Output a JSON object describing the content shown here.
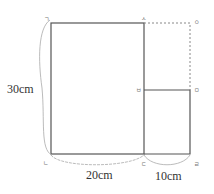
{
  "diagram": {
    "points": {
      "top_left": "ㄱ",
      "top_mid": "ㅅ",
      "top_right": "ㅇ",
      "mid_left": "ㅂ",
      "mid_right": "ㅁ",
      "bottom_left": "ㄴ",
      "bottom_mid": "ㄷ",
      "bottom_right": "ㄹ"
    },
    "dimensions": {
      "left": "30cm",
      "bottom_left": "20cm",
      "bottom_right": "10cm"
    },
    "colors": {
      "line": "#555555",
      "dotted": "#888888",
      "brace": "#aaaaaa",
      "label": "#777777"
    }
  }
}
